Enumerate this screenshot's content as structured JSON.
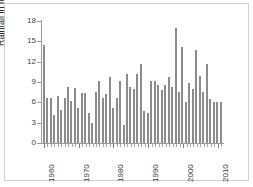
{
  "chart_data": {
    "type": "bar",
    "title": "",
    "xlabel": "",
    "ylabel": "Rainfall  in mm",
    "ylim": [
      0,
      18
    ],
    "y_ticks": [
      0,
      3,
      6,
      9,
      12,
      15,
      18
    ],
    "y_tick_labels": [
      "0",
      "3",
      "6",
      "9",
      "12",
      "15",
      "18"
    ],
    "x_tick_labels": [
      "1960",
      "1970",
      "1980",
      "1990",
      "2000",
      "2010"
    ],
    "x_tick_years": [
      1960,
      1970,
      1980,
      1990,
      2000,
      2010
    ],
    "grid": false,
    "legend": false,
    "bar_color": "#8c8c8c",
    "axis_color": "#9a9a9a",
    "categories": [
      "1960",
      "1961",
      "1962",
      "1963",
      "1964",
      "1965",
      "1966",
      "1967",
      "1968",
      "1969",
      "1970",
      "1971",
      "1972",
      "1973",
      "1974",
      "1975",
      "1976",
      "1977",
      "1978",
      "1979",
      "1980",
      "1981",
      "1982",
      "1983",
      "1984",
      "1985",
      "1986",
      "1987",
      "1988",
      "1989",
      "1990",
      "1991",
      "1992",
      "1993",
      "1994",
      "1995",
      "1996",
      "1997",
      "1998",
      "1999",
      "2000",
      "2001",
      "2002",
      "2003",
      "2004",
      "2005",
      "2006",
      "2007",
      "2008",
      "2009",
      "2010",
      "2011"
    ],
    "values": [
      14.5,
      6.6,
      6.6,
      4.2,
      6.9,
      4.9,
      6.7,
      8.2,
      6.2,
      8.1,
      5.1,
      7.4,
      7.4,
      4.5,
      3.0,
      7.6,
      9.2,
      6.7,
      7.2,
      9.8,
      5.2,
      6.7,
      9.1,
      2.6,
      10.2,
      8.2,
      8.0,
      10.2,
      11.7,
      4.7,
      4.4,
      9.2,
      9.1,
      8.6,
      7.8,
      8.5,
      9.8,
      8.3,
      17.0,
      7.6,
      14.1,
      6.1,
      8.9,
      8.0,
      13.7,
      9.9,
      7.6,
      11.6,
      6.5,
      6.0,
      6.0,
      6.0
    ]
  }
}
